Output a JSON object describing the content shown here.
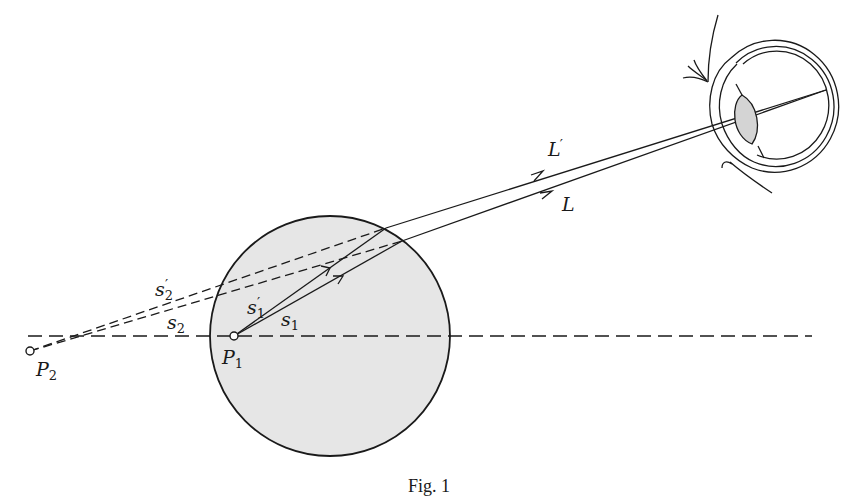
{
  "figure": {
    "caption": "Fig. 1",
    "colors": {
      "stroke": "#1a1a1a",
      "sphere_fill": "#e6e6e6",
      "lens_fill": "#d4d4d4",
      "background": "#ffffff"
    },
    "labels": {
      "P1": {
        "base": "P",
        "sub": "1"
      },
      "P2": {
        "base": "P",
        "sub": "2"
      },
      "s1": {
        "base": "s",
        "sub": "1"
      },
      "s1_prime": {
        "base": "s",
        "sub": "1",
        "prime": "′"
      },
      "s2": {
        "base": "s",
        "sub": "2"
      },
      "s2_prime": {
        "base": "s",
        "sub": "2",
        "prime": "′"
      },
      "L": {
        "base": "L"
      },
      "L_prime": {
        "base": "L",
        "prime": "′"
      }
    },
    "elements": {
      "sphere": "transparent sphere",
      "eye": "observer eye",
      "axis": "optical axis (dashed)"
    }
  }
}
